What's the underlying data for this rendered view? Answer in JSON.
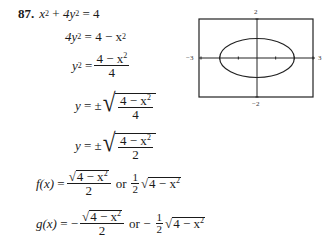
{
  "problem": {
    "number": "87.",
    "eq1": {
      "lhs_x": "x",
      "lhs_y": "4y",
      "exp": "2",
      "rhs": "4",
      "plus": "+",
      "eq": "="
    },
    "eq2": {
      "lhs": "4y",
      "exp": "2",
      "eq": "=",
      "rhs": "4 − x",
      "rhs_exp": "2"
    },
    "eq3": {
      "lhs": "y",
      "exp": "2",
      "eq": "=",
      "num": "4 − x",
      "num_exp": "2",
      "den": "4"
    },
    "eq4": {
      "lhs": "y",
      "eq": "= ±",
      "num": "4 − x",
      "num_exp": "2",
      "den": "4"
    },
    "eq5": {
      "lhs": "y",
      "eq": "= ±",
      "num": "4 − x",
      "num_exp": "2",
      "den": "2"
    },
    "f": {
      "name": "f(x)",
      "eq": "=",
      "num": "4 − x",
      "exp": "2",
      "den": "2",
      "or": "or",
      "coef_num": "1",
      "coef_den": "2"
    },
    "g": {
      "name": "g(x)",
      "eq": "= −",
      "num": "4 − x",
      "exp": "2",
      "den": "2",
      "or": "or −",
      "coef_num": "1",
      "coef_den": "2"
    }
  },
  "graph": {
    "xmin_label": "−3",
    "xmax_label": "3",
    "ymin_label": "−2",
    "ymax_label": "2",
    "xrange": [
      -3,
      3
    ],
    "yrange": [
      -2,
      2
    ],
    "ellipse": {
      "a": 2,
      "b": 1
    }
  }
}
